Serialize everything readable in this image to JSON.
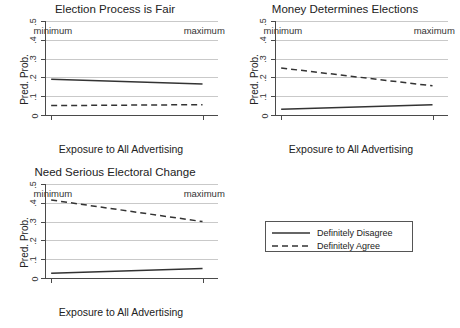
{
  "chart_data": [
    {
      "type": "line",
      "title": "Election Process is Fair",
      "xlabel": "Exposure to All Advertising",
      "ylabel": "Pred. Prob.",
      "ylim": [
        0,
        0.5
      ],
      "yticks": [
        "0",
        ".1",
        ".2",
        ".3",
        ".4",
        ".5"
      ],
      "ytick_values": [
        0,
        0.1,
        0.2,
        0.3,
        0.4,
        0.5
      ],
      "x": [
        "minimum",
        "maximum"
      ],
      "grid": true,
      "series": [
        {
          "name": "Definitely Disagree",
          "style": "solid",
          "values": [
            0.19,
            0.165
          ]
        },
        {
          "name": "Definitely Agree",
          "style": "dashed",
          "values": [
            0.05,
            0.055
          ]
        }
      ]
    },
    {
      "type": "line",
      "title": "Money Determines Elections",
      "xlabel": "Exposure to All Advertising",
      "ylabel": "Pred. Prob.",
      "ylim": [
        0,
        0.5
      ],
      "yticks": [
        "0",
        ".1",
        ".2",
        ".3",
        ".4",
        ".5"
      ],
      "ytick_values": [
        0,
        0.1,
        0.2,
        0.3,
        0.4,
        0.5
      ],
      "x": [
        "minimum",
        "maximum"
      ],
      "grid": true,
      "series": [
        {
          "name": "Definitely Disagree",
          "style": "solid",
          "values": [
            0.03,
            0.055
          ]
        },
        {
          "name": "Definitely Agree",
          "style": "dashed",
          "values": [
            0.25,
            0.155
          ]
        }
      ]
    },
    {
      "type": "line",
      "title": "Need Serious Electoral Change",
      "xlabel": "Exposure to All Advertising",
      "ylabel": "Pred. Prob.",
      "ylim": [
        0,
        0.5
      ],
      "yticks": [
        "0",
        ".1",
        ".2",
        ".3",
        ".4",
        ".5"
      ],
      "ytick_values": [
        0,
        0.1,
        0.2,
        0.3,
        0.4,
        0.5
      ],
      "x": [
        "minimum",
        "maximum"
      ],
      "grid": true,
      "series": [
        {
          "name": "Definitely Disagree",
          "style": "solid",
          "values": [
            0.025,
            0.05
          ]
        },
        {
          "name": "Definitely Agree",
          "style": "dashed",
          "values": [
            0.415,
            0.3
          ]
        }
      ]
    }
  ],
  "legend": {
    "position": "bottom-right",
    "items": [
      {
        "label": "Definitely Disagree",
        "style": "solid"
      },
      {
        "label": "Definitely Agree",
        "style": "dashed"
      }
    ]
  },
  "colors": {
    "line": "#333333",
    "grid": "#c9c9c9",
    "axis": "#4a4a4a",
    "text": "#222222",
    "background": "#ffffff"
  }
}
